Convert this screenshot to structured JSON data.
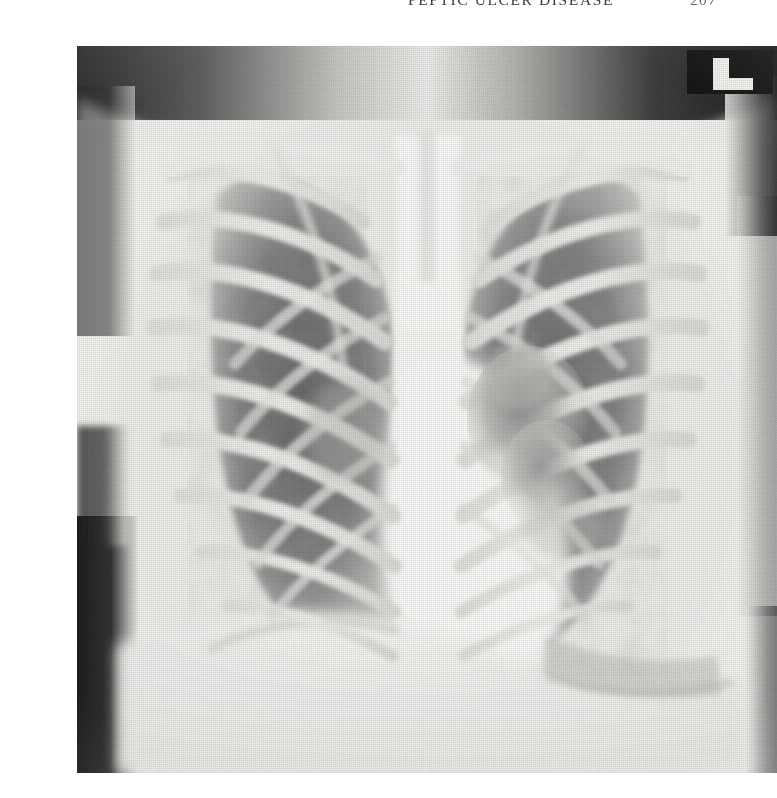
{
  "page": {
    "header_title": "PEPTIC ULCER DISEASE",
    "page_number": "207",
    "background_color": "#ffffff"
  },
  "figure": {
    "name": "chest-radiograph",
    "modality": "Chest radiograph",
    "view": "Posteroanterior (PA)",
    "side_marker": "L",
    "plate": {
      "left": 37,
      "top": 30,
      "width": 700,
      "height": 727,
      "border_color": "#d8d6d2"
    },
    "tones": {
      "film_background_dark": "#1d1d1d",
      "soft_tissue_mid": "#9a9a9a",
      "lung_field_dark": "#6f6f6f",
      "rib_bright": "#e9e8e5",
      "mediastinum_white": "#fbfbfa",
      "paper_white": "#f7f6f3"
    },
    "regions": [
      {
        "id": "apex-dark-band",
        "label": "Dark exposure band across lung apices"
      },
      {
        "id": "right-clavicle",
        "label": "Right clavicle"
      },
      {
        "id": "left-clavicle",
        "label": "Left clavicle"
      },
      {
        "id": "right-lung-field",
        "label": "Right lung field"
      },
      {
        "id": "left-lung-field",
        "label": "Left lung field"
      },
      {
        "id": "rib-cage-right",
        "label": "Right posterior and anterior ribs"
      },
      {
        "id": "rib-cage-left",
        "label": "Left posterior and anterior ribs"
      },
      {
        "id": "mediastinum",
        "label": "Mediastinum and trachea"
      },
      {
        "id": "cardiac-silhouette",
        "label": "Cardiac silhouette"
      },
      {
        "id": "right-hilar-infiltrate",
        "label": "Right hilar infiltrate / consolidation"
      },
      {
        "id": "right-hemidiaphragm",
        "label": "Right hemidiaphragm"
      },
      {
        "id": "left-hemidiaphragm",
        "label": "Left hemidiaphragm"
      },
      {
        "id": "left-margin-shadow",
        "label": "Dark lateral soft tissue margin"
      },
      {
        "id": "side-marker-l",
        "label": "Radiographic left side marker"
      }
    ]
  }
}
